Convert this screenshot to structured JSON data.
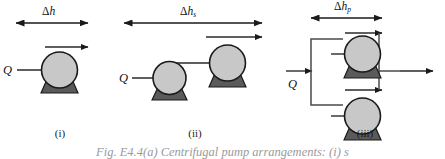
{
  "figure": {
    "caption": "Fig. E4.4(a)   Centrifugal pump arrangements: (i) s",
    "panels": [
      {
        "id": "i",
        "label": "(i)",
        "head_label_delta": "Δ",
        "head_label_var": "h",
        "head_label_sub": "",
        "inlet_label": "Q",
        "pump_count": 1,
        "arrangement": "single"
      },
      {
        "id": "ii",
        "label": "(ii)",
        "head_label_delta": "Δ",
        "head_label_var": "h",
        "head_label_sub": "s",
        "inlet_label": "Q",
        "pump_count": 2,
        "arrangement": "series"
      },
      {
        "id": "iii",
        "label": "(iii)",
        "head_label_delta": "Δ",
        "head_label_var": "h",
        "head_label_sub": "p",
        "inlet_label": "Q",
        "pump_count": 2,
        "arrangement": "parallel"
      }
    ],
    "colors": {
      "impeller_fill": "#c8c8c8",
      "impeller_stroke": "#1a1a1a",
      "base_fill": "#5a5a5a",
      "base_stroke": "#1a1a1a",
      "line": "#2a2a2a",
      "pipe": "#4a4a4a",
      "background": "#ffffff",
      "caption_text": "#9a9a9a"
    }
  }
}
